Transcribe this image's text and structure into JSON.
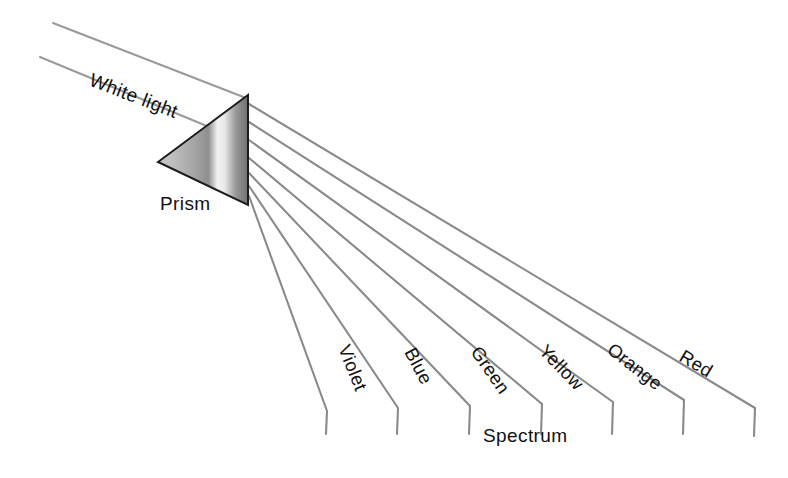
{
  "diagram": {
    "background_color": "#ffffff",
    "line_color": "#8a8a8a",
    "outline_color": "#1c1c1c",
    "text_color": "#111111"
  },
  "labels": {
    "white_light": "White light",
    "prism": "Prism",
    "spectrum": "Spectrum"
  },
  "prism": {
    "apex": {
      "x": 248,
      "y": 95
    },
    "left_vertex": {
      "x": 158,
      "y": 162
    },
    "bottom_vertex": {
      "x": 248,
      "y": 205
    },
    "fill_description": "grey gradient with bright highlight band"
  },
  "incoming_beam": {
    "upper_line": {
      "x1": 53,
      "y1": 23,
      "x2": 246,
      "y2": 98
    },
    "lower_line": {
      "x1": 40,
      "y1": 57,
      "x2": 243,
      "y2": 140
    },
    "label_rotation_deg": 21
  },
  "spectrum_rays": [
    {
      "name": "Violet",
      "label": "Violet",
      "label_rotation_deg": 68,
      "label_x": 338,
      "label_y": 348,
      "start_x": 249,
      "start_y": 196,
      "bend_x": 327,
      "bend_y": 411,
      "end_x": 326,
      "end_y": 434
    },
    {
      "name": "Blue",
      "label": "Blue",
      "label_rotation_deg": 62,
      "label_x": 404,
      "label_y": 352,
      "start_x": 249,
      "start_y": 186,
      "bend_x": 398,
      "bend_y": 408,
      "end_x": 397,
      "end_y": 434
    },
    {
      "name": "Green",
      "label": "Green",
      "label_rotation_deg": 55,
      "label_x": 470,
      "label_y": 352,
      "start_x": 249,
      "start_y": 173,
      "bend_x": 470,
      "bend_y": 406,
      "end_x": 469,
      "end_y": 434
    },
    {
      "name": "Yellow",
      "label": "Yellow",
      "label_rotation_deg": 46,
      "label_x": 538,
      "label_y": 352,
      "start_x": 249,
      "start_y": 158,
      "bend_x": 542,
      "bend_y": 404,
      "end_x": 541,
      "end_y": 434
    },
    {
      "name": "Orange",
      "label": "Orange",
      "label_rotation_deg": 38,
      "label_x": 606,
      "label_y": 352,
      "start_x": 249,
      "start_y": 140,
      "bend_x": 613,
      "bend_y": 402,
      "end_x": 612,
      "end_y": 434
    },
    {
      "name": "Red",
      "label": "Red",
      "label_rotation_deg": 31,
      "label_x": 678,
      "label_y": 360,
      "start_x": 249,
      "start_y": 122,
      "bend_x": 684,
      "bend_y": 400,
      "end_x": 683,
      "end_y": 434
    },
    {
      "name": "Outer edge",
      "label": "",
      "label_rotation_deg": 26,
      "label_x": 0,
      "label_y": 0,
      "start_x": 249,
      "start_y": 104,
      "bend_x": 755,
      "bend_y": 408,
      "end_x": 754,
      "end_y": 436
    }
  ],
  "annotations": {
    "white_light_x": 88,
    "white_light_y": 85,
    "prism_label_x": 160,
    "prism_label_y": 210,
    "spectrum_label_x": 483,
    "spectrum_label_y": 442
  }
}
